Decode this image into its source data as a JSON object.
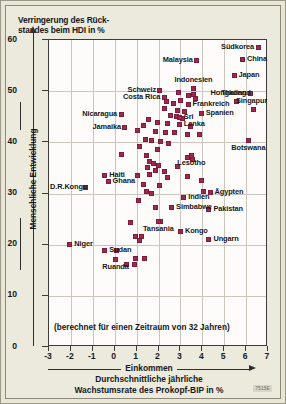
{
  "title": {
    "line1": "Verringerung des Rück-",
    "line2": "standes beim HDI in %"
  },
  "note": "(berechnet für einen Zeitraum von 32 Jahren)",
  "xcaption": {
    "line1": "Einkommen",
    "line2": "Durchschnittliche jährliche",
    "line3": "Wachstumsrate des Prokopf-BIP in %"
  },
  "ylabel": "Menschliche Entwicklung",
  "code": "7515E",
  "colors": {
    "marker": "#a0274d",
    "marker_border": "#7d1d3a",
    "plot_bg": "#fdfcfa",
    "page_bg": "#eceadd",
    "grid": "#c9c6bd",
    "axis": "#3b3b3b",
    "text": "#15181c"
  },
  "chart_data": {
    "type": "scatter",
    "xlabel": "Einkommen — Durchschnittliche jährliche Wachstumsrate des Prokopf-BIP in %",
    "ylabel": "Menschliche Entwicklung",
    "xlim": [
      -3,
      7
    ],
    "ylim": [
      0,
      60
    ],
    "xticks": [
      -3,
      -2,
      -1,
      0,
      1,
      2,
      3,
      4,
      5,
      6,
      7
    ],
    "yticks": [
      0,
      10,
      20,
      30,
      40,
      50,
      60
    ],
    "grid": true,
    "legend": "none",
    "annotation": "(berechnet für einen Zeitraum von 32 Jahren)",
    "labeled_points": [
      {
        "label": "Südkorea",
        "x": 6.55,
        "y": 58.6,
        "side": "left"
      },
      {
        "label": "China",
        "x": 5.85,
        "y": 56.2,
        "side": "right"
      },
      {
        "label": "Malaysia",
        "x": 3.75,
        "y": 56.0,
        "side": "left"
      },
      {
        "label": "Japan",
        "x": 5.45,
        "y": 53.1,
        "side": "right"
      },
      {
        "label": "Schweiz",
        "x": 2.05,
        "y": 50.2,
        "side": "left"
      },
      {
        "label": "Indonesien",
        "x": 3.6,
        "y": 50.6,
        "side": "above"
      },
      {
        "label": "Hongkong",
        "x": 6.2,
        "y": 49.6,
        "side": "left"
      },
      {
        "label": "Costa Rica",
        "x": 2.25,
        "y": 48.7,
        "side": "left"
      },
      {
        "label": "Thailand",
        "x": 5.55,
        "y": 48.0,
        "side": "above"
      },
      {
        "label": "Frankreich",
        "x": 3.35,
        "y": 47.4,
        "side": "right"
      },
      {
        "label": "Singapur",
        "x": 6.35,
        "y": 46.5,
        "side": "above"
      },
      {
        "label": "Spanien",
        "x": 3.95,
        "y": 45.6,
        "side": "right"
      },
      {
        "label": "Sri",
        "x": 2.95,
        "y": 44.8,
        "side": "right"
      },
      {
        "label": "Lanka",
        "x": 2.95,
        "y": 43.4,
        "side": "right"
      },
      {
        "label": "Nicaragua",
        "x": 0.3,
        "y": 45.4,
        "side": "left"
      },
      {
        "label": "Jamaika",
        "x": 0.45,
        "y": 43.0,
        "side": "left"
      },
      {
        "label": "Botswana",
        "x": 6.1,
        "y": 40.3,
        "side": "below"
      },
      {
        "label": "Lesotho",
        "x": 3.5,
        "y": 37.4,
        "side": "below"
      },
      {
        "label": "D.R.Kongo",
        "x": -1.35,
        "y": 31.2,
        "side": "left"
      },
      {
        "label": "Haiti",
        "x": -0.45,
        "y": 33.5,
        "side": "right"
      },
      {
        "label": "Ghana",
        "x": -0.3,
        "y": 32.3,
        "side": "right"
      },
      {
        "label": "Ägypten",
        "x": 4.35,
        "y": 30.3,
        "side": "right"
      },
      {
        "label": "Indien",
        "x": 3.15,
        "y": 29.3,
        "side": "right"
      },
      {
        "label": "Simbabwe",
        "x": 2.6,
        "y": 27.2,
        "side": "right"
      },
      {
        "label": "Pakistan",
        "x": 4.3,
        "y": 26.8,
        "side": "right"
      },
      {
        "label": "Tansania",
        "x": 2.0,
        "y": 24.5,
        "side": "below"
      },
      {
        "label": "Kongo",
        "x": 3.0,
        "y": 22.6,
        "side": "right"
      },
      {
        "label": "Ungarn",
        "x": 4.3,
        "y": 21.0,
        "side": "right"
      },
      {
        "label": "Niger",
        "x": -2.05,
        "y": 20.1,
        "side": "right"
      },
      {
        "label": "Sudan",
        "x": -0.45,
        "y": 18.9,
        "side": "right"
      },
      {
        "label": "Ruanda",
        "x": 0.05,
        "y": 17.2,
        "side": "below"
      }
    ],
    "unlabeled_points": [
      {
        "x": 2.9,
        "y": 49.7
      },
      {
        "x": 3.35,
        "y": 49.2
      },
      {
        "x": 3.6,
        "y": 49.3
      },
      {
        "x": 2.35,
        "y": 47.9
      },
      {
        "x": 2.7,
        "y": 47.6
      },
      {
        "x": 3.0,
        "y": 48.2
      },
      {
        "x": 3.7,
        "y": 48.5
      },
      {
        "x": 2.25,
        "y": 46.7
      },
      {
        "x": 2.85,
        "y": 46.3
      },
      {
        "x": 3.2,
        "y": 46.1
      },
      {
        "x": 2.55,
        "y": 45.3
      },
      {
        "x": 2.8,
        "y": 45.0
      },
      {
        "x": 3.1,
        "y": 44.6
      },
      {
        "x": 1.55,
        "y": 44.4
      },
      {
        "x": 1.95,
        "y": 43.8
      },
      {
        "x": 1.3,
        "y": 43.3
      },
      {
        "x": 2.4,
        "y": 43.6
      },
      {
        "x": 3.45,
        "y": 43.1
      },
      {
        "x": 1.05,
        "y": 42.3
      },
      {
        "x": 1.85,
        "y": 42.2
      },
      {
        "x": 2.3,
        "y": 42.0
      },
      {
        "x": 2.75,
        "y": 41.9
      },
      {
        "x": 3.3,
        "y": 41.6
      },
      {
        "x": 3.85,
        "y": 41.5
      },
      {
        "x": 1.4,
        "y": 40.6
      },
      {
        "x": 1.7,
        "y": 40.3
      },
      {
        "x": 2.1,
        "y": 40.1
      },
      {
        "x": 2.45,
        "y": 39.7
      },
      {
        "x": 1.15,
        "y": 39.1
      },
      {
        "x": 1.95,
        "y": 38.6
      },
      {
        "x": 0.3,
        "y": 37.6
      },
      {
        "x": 1.45,
        "y": 37.5
      },
      {
        "x": 3.3,
        "y": 37.0
      },
      {
        "x": 3.55,
        "y": 36.6
      },
      {
        "x": 1.6,
        "y": 36.2
      },
      {
        "x": 1.75,
        "y": 35.8
      },
      {
        "x": 2.0,
        "y": 35.4
      },
      {
        "x": 1.5,
        "y": 35.0
      },
      {
        "x": 2.85,
        "y": 35.2
      },
      {
        "x": 1.85,
        "y": 34.6
      },
      {
        "x": 2.25,
        "y": 34.4
      },
      {
        "x": 1.05,
        "y": 33.6
      },
      {
        "x": 1.6,
        "y": 33.8
      },
      {
        "x": 2.4,
        "y": 33.2
      },
      {
        "x": 3.3,
        "y": 33.4
      },
      {
        "x": 3.95,
        "y": 32.6
      },
      {
        "x": 1.3,
        "y": 31.8
      },
      {
        "x": 2.05,
        "y": 31.5
      },
      {
        "x": 1.45,
        "y": 30.4
      },
      {
        "x": 1.7,
        "y": 30.1
      },
      {
        "x": 4.05,
        "y": 30.4
      },
      {
        "x": 1.1,
        "y": 28.7
      },
      {
        "x": 1.85,
        "y": 27.3
      },
      {
        "x": 2.1,
        "y": 24.6
      },
      {
        "x": 0.7,
        "y": 24.3
      },
      {
        "x": 0.95,
        "y": 21.7
      },
      {
        "x": 1.2,
        "y": 21.6
      },
      {
        "x": 1.15,
        "y": 20.9
      },
      {
        "x": 0.1,
        "y": 18.8
      },
      {
        "x": 0.95,
        "y": 17.4
      },
      {
        "x": 1.35,
        "y": 17.3
      },
      {
        "x": 0.55,
        "y": 16.2
      },
      {
        "x": 0.9,
        "y": 16.1
      }
    ]
  }
}
